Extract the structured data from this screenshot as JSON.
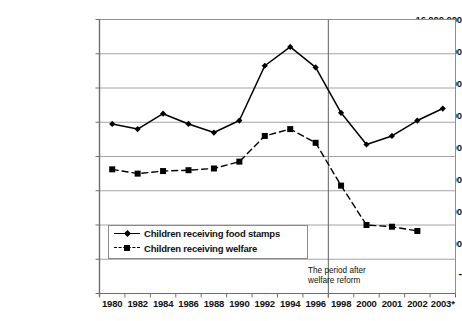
{
  "chart_data": {
    "type": "line",
    "title": "",
    "xlabel": "",
    "ylabel": "",
    "grid": true,
    "legend_position": "inside-bottom-left",
    "categories": [
      "1980",
      "1982",
      "1984",
      "1986",
      "1988",
      "1990",
      "1992",
      "1994",
      "1996",
      "1998",
      "2000",
      "2001",
      "2002",
      "2003*"
    ],
    "ylim": [
      0,
      16000000
    ],
    "ytick_labels": [
      "-",
      "2,000,000",
      "4,000,000",
      "6,000,000",
      "8,000,000",
      "10,000,000",
      "12,000,000",
      "14,000,000",
      "16,000,000"
    ],
    "ytick_values": [
      0,
      2000000,
      4000000,
      6000000,
      8000000,
      10000000,
      12000000,
      14000000,
      16000000
    ],
    "series": [
      {
        "name": "Children receiving food stamps",
        "marker": "diamond",
        "line_style": "solid",
        "color": "#000000",
        "values": [
          9900000,
          9600000,
          10500000,
          9900000,
          9400000,
          10100000,
          13300000,
          14400000,
          13200000,
          10550000,
          8700000,
          9200000,
          10100000,
          10800000
        ]
      },
      {
        "name": "Children receiving welfare",
        "marker": "square",
        "line_style": "dashed",
        "color": "#000000",
        "values": [
          7250000,
          7000000,
          7150000,
          7200000,
          7300000,
          7700000,
          9200000,
          9600000,
          8800000,
          6300000,
          4000000,
          3900000,
          3650000,
          null
        ]
      }
    ],
    "annotations": [
      {
        "text_line1": "The period after",
        "text_line2": "welfare reform",
        "x_category": "1996"
      }
    ],
    "reference_line": {
      "after_category": "1996",
      "orientation": "vertical"
    }
  },
  "legend": {
    "items": [
      {
        "label": "Children receiving food stamps"
      },
      {
        "label": "Children receiving welfare"
      }
    ]
  },
  "annotation": {
    "line1": "The period after",
    "line2": "welfare reform"
  },
  "colors": {
    "axis": "#7a7a7a",
    "grid": "#9a9a9a",
    "series": "#000000",
    "background": "#ffffff"
  }
}
